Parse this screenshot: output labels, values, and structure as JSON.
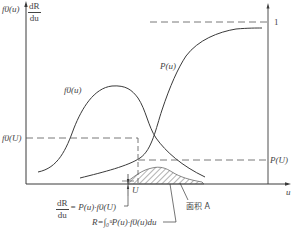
{
  "diagram": {
    "y_axis_label_left": "f0(u)",
    "y_axis_label_right_num": "dR",
    "y_axis_label_right_den": "du",
    "x_axis_label": "u",
    "right_axis_tick": "1",
    "curve_P_label": "P(u)",
    "curve_f0_label": "f0(u)",
    "f0U_label": "f0(U)",
    "PU_label": "P(U)",
    "U_label": "U",
    "area_label": "面积 A",
    "eq1_num": "dR",
    "eq1_den": "du",
    "eq1_rhs": "= P(u)·f0(U)",
    "eq2": "R=∫₀ᵘP(u)·f0(u)du"
  },
  "colors": {
    "line": "#3a3a3a",
    "dash": "#555555",
    "hatch": "#555555",
    "background": "#ffffff"
  }
}
